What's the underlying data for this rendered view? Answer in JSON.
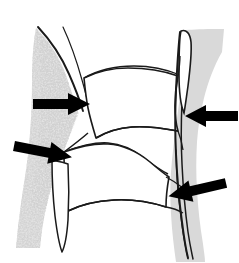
{
  "figure": {
    "title": "Lateral line drawing of two adjacent vertebral bodies",
    "type": "anatomical-line-illustration",
    "background_color": "#ffffff",
    "stroke_color": "#1a1a1a",
    "canvas": {
      "width": 239,
      "height": 263
    }
  },
  "regions": [
    {
      "id": "left-soft-tissue-mass",
      "label": "Speckled grey soft-tissue mass (left / anterior)",
      "fill_color": "#b0b0b0",
      "texture": "stippled",
      "side": "left"
    },
    {
      "id": "right-soft-tissue-band",
      "label": "Smooth grey soft-tissue band (right / posterior)",
      "fill_color": "#d9d9d9",
      "texture": "solid",
      "side": "right"
    },
    {
      "id": "upper-vertebral-body",
      "label": "Upper vertebral body",
      "fill_color": "#ffffff"
    },
    {
      "id": "lower-vertebral-body",
      "label": "Lower vertebral body",
      "fill_color": "#ffffff"
    },
    {
      "id": "intervertebral-disc-space",
      "label": "Intervertebral disc space",
      "fill_color": "#ffffff"
    }
  ],
  "arrows": [
    {
      "id": "arrow-upper-left",
      "label": "Arrow 1 — upper left, pointing right",
      "direction": "right",
      "angle_deg": 0,
      "color": "#000000",
      "tip": {
        "x": 89,
        "y": 104
      },
      "tail": {
        "x": 33,
        "y": 104
      }
    },
    {
      "id": "arrow-lower-left",
      "label": "Arrow 2 — lower left, pointing right and slightly down",
      "direction": "right-down",
      "angle_deg": 12,
      "color": "#000000",
      "tip": {
        "x": 72,
        "y": 152
      },
      "tail": {
        "x": 14,
        "y": 141
      }
    },
    {
      "id": "arrow-upper-right",
      "label": "Arrow 3 — upper right, pointing left",
      "direction": "left",
      "angle_deg": 180,
      "color": "#000000",
      "tip": {
        "x": 186,
        "y": 116
      },
      "tail": {
        "x": 238,
        "y": 116
      }
    },
    {
      "id": "arrow-lower-right",
      "label": "Arrow 4 — lower right, pointing left and slightly up",
      "direction": "left-up",
      "angle_deg": 194,
      "color": "#000000",
      "tip": {
        "x": 166,
        "y": 176
      },
      "tail": {
        "x": 225,
        "y": 188
      }
    }
  ],
  "colors": {
    "stroke": "#1a1a1a",
    "arrow": "#000000",
    "speckle_gray": "#a8a8a8",
    "band_gray": "#d9d9d9",
    "white": "#ffffff"
  }
}
